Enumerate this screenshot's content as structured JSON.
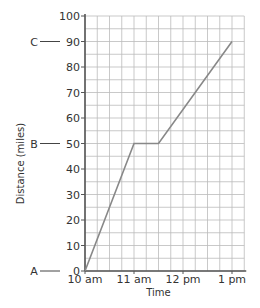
{
  "chart_data": {
    "type": "line",
    "title": "",
    "xlabel": "Time",
    "ylabel": "Distance (miles)",
    "x": [
      "10 am",
      "11 am",
      "11:30 am",
      "1 pm"
    ],
    "x_hours": [
      10,
      11,
      11.5,
      13
    ],
    "values": [
      0,
      50,
      50,
      90
    ],
    "series": [
      {
        "name": "Distance",
        "x_hours": [
          10,
          11,
          11.5,
          13
        ],
        "values": [
          0,
          50,
          50,
          90
        ]
      }
    ],
    "xlim": [
      10,
      13.25
    ],
    "ylim": [
      0,
      100
    ],
    "x_ticks": [
      {
        "value": 10,
        "label": "10 am"
      },
      {
        "value": 11,
        "label": "11 am"
      },
      {
        "value": 12,
        "label": "12 pm"
      },
      {
        "value": 13,
        "label": "1 pm"
      }
    ],
    "y_ticks": [
      0,
      10,
      20,
      30,
      40,
      50,
      60,
      70,
      80,
      90,
      100
    ],
    "grid": true,
    "grid_minor_x_step": 0.25,
    "grid_minor_y_step": 5,
    "annotations": [
      {
        "label": "A",
        "y": 0
      },
      {
        "label": "B",
        "y": 50
      },
      {
        "label": "C",
        "y": 90
      }
    ],
    "colors": {
      "line": "#888888",
      "grid": "#bbbbbb",
      "axis": "#555555",
      "text": "#333333"
    }
  }
}
